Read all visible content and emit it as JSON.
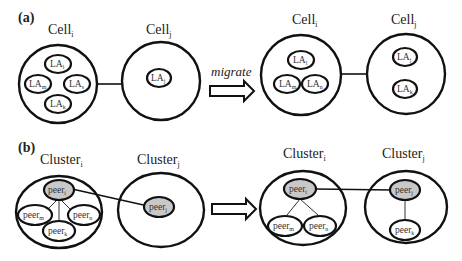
{
  "panel_a": {
    "label": "(a)",
    "before": {
      "cell_i": {
        "title": "Cell",
        "sub": "i",
        "nodes": [
          {
            "name": "LA",
            "sub": "l"
          },
          {
            "name": "LA",
            "sub": "m"
          },
          {
            "name": "LA",
            "sub": "s"
          },
          {
            "name": "LA",
            "sub": "k"
          }
        ]
      },
      "cell_j": {
        "title": "Cell",
        "sub": "j",
        "nodes": [
          {
            "name": "LA",
            "sub": "j"
          }
        ]
      }
    },
    "arrow_label": "migrate",
    "after": {
      "cell_i": {
        "title": "Cell",
        "sub": "i",
        "nodes": [
          {
            "name": "LA",
            "sub": "l"
          },
          {
            "name": "LA",
            "sub": "m"
          },
          {
            "name": "LA",
            "sub": "n"
          }
        ]
      },
      "cell_j": {
        "title": "Cell",
        "sub": "j",
        "nodes": [
          {
            "name": "LA",
            "sub": "j"
          },
          {
            "name": "LA",
            "sub": "k"
          }
        ]
      }
    }
  },
  "panel_b": {
    "label": "(b)",
    "before": {
      "cluster_i": {
        "title": "Cluster",
        "sub": "i",
        "head": {
          "name": "peer",
          "sub": "i"
        },
        "nodes": [
          {
            "name": "peer",
            "sub": "m"
          },
          {
            "name": "peer",
            "sub": "n"
          },
          {
            "name": "peer",
            "sub": "k"
          }
        ]
      },
      "cluster_j": {
        "title": "Cluster",
        "sub": "j",
        "head": {
          "name": "peer",
          "sub": "j"
        },
        "nodes": []
      }
    },
    "after": {
      "cluster_i": {
        "title": "Cluster",
        "sub": "i",
        "head": {
          "name": "peer",
          "sub": "i"
        },
        "nodes": [
          {
            "name": "peer",
            "sub": "m"
          },
          {
            "name": "peer",
            "sub": "n"
          }
        ]
      },
      "cluster_j": {
        "title": "Cluster",
        "sub": "j",
        "head": {
          "name": "peer",
          "sub": "j"
        },
        "nodes": [
          {
            "name": "peer",
            "sub": "k"
          }
        ]
      }
    }
  }
}
